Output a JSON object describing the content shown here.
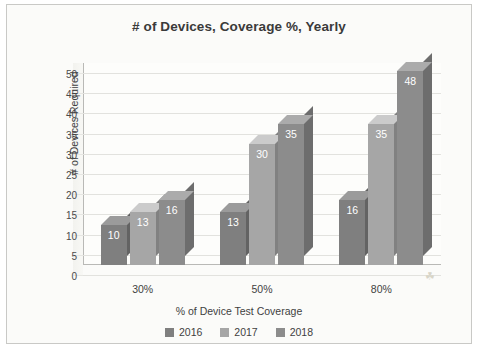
{
  "chart_data": {
    "type": "bar",
    "title": "# of Devices, Coverage %, Yearly",
    "xlabel": "% of Device Test Coverage",
    "ylabel": "# of Devices Required",
    "categories": [
      "30%",
      "50%",
      "80%"
    ],
    "series": [
      {
        "name": "2016",
        "values": [
          10,
          13,
          16
        ],
        "color": "#7f7f7f"
      },
      {
        "name": "2017",
        "values": [
          13,
          30,
          35
        ],
        "color": "#a6a6a6"
      },
      {
        "name": "2018",
        "values": [
          16,
          35,
          48
        ],
        "color": "#8c8c8c"
      }
    ],
    "ylim": [
      0,
      50
    ],
    "yticks": [
      "0",
      "5",
      "10",
      "15",
      "20",
      "25",
      "30",
      "35",
      "40",
      "45",
      "50"
    ],
    "grid": true,
    "legend_position": "bottom",
    "style": "3d-column"
  },
  "legend": [
    {
      "label": "2016"
    },
    {
      "label": "2017"
    },
    {
      "label": "2018"
    }
  ]
}
